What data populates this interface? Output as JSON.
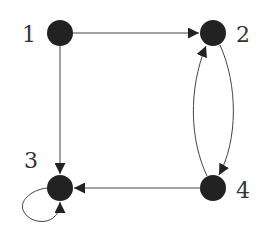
{
  "diagram": {
    "type": "directed-graph",
    "colors": {
      "node": "#222222",
      "edge": "#444444",
      "label": "#333333",
      "background": "#ffffff"
    },
    "nodes": [
      {
        "id": "1",
        "label": "1",
        "x": 60,
        "y": 33,
        "r": 13,
        "label_x": 22,
        "label_y": 24
      },
      {
        "id": "2",
        "label": "2",
        "x": 213,
        "y": 33,
        "r": 13,
        "label_x": 236,
        "label_y": 24
      },
      {
        "id": "3",
        "label": "3",
        "x": 60,
        "y": 188,
        "r": 13,
        "label_x": 24,
        "label_y": 150
      },
      {
        "id": "4",
        "label": "4",
        "x": 213,
        "y": 188,
        "r": 13,
        "label_x": 236,
        "label_y": 182
      }
    ],
    "edges": [
      {
        "from": "1",
        "to": "2",
        "shape": "straight"
      },
      {
        "from": "1",
        "to": "3",
        "shape": "straight"
      },
      {
        "from": "4",
        "to": "3",
        "shape": "straight"
      },
      {
        "from": "4",
        "to": "2",
        "shape": "curved-left"
      },
      {
        "from": "2",
        "to": "4",
        "shape": "curved-right"
      },
      {
        "from": "3",
        "to": "3",
        "shape": "self-loop"
      }
    ]
  }
}
